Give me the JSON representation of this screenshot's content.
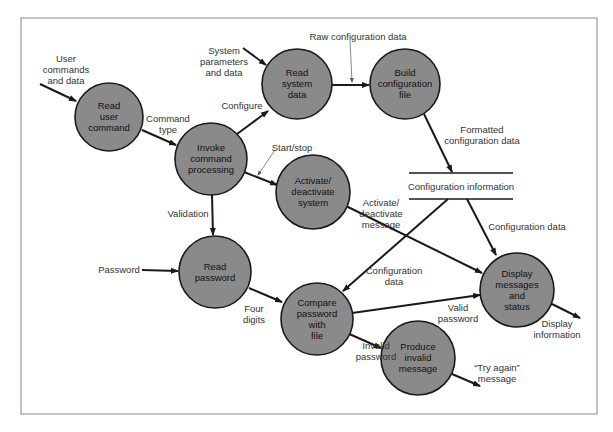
{
  "diagram": {
    "type": "data-flow-diagram",
    "processes": [
      {
        "id": "read_user_command",
        "lines": [
          "Read",
          "user",
          "command"
        ],
        "cx": 109,
        "cy": 117,
        "r": 34
      },
      {
        "id": "invoke_command_processing",
        "lines": [
          "Invoke",
          "command",
          "processing"
        ],
        "cx": 211,
        "cy": 159,
        "r": 36
      },
      {
        "id": "read_system_data",
        "lines": [
          "Read",
          "system",
          "data"
        ],
        "cx": 297,
        "cy": 84,
        "r": 35
      },
      {
        "id": "build_configuration_file",
        "lines": [
          "Build",
          "configuration",
          "file"
        ],
        "cx": 405,
        "cy": 84,
        "r": 35
      },
      {
        "id": "activate_deactivate_system",
        "lines": [
          "Activate/",
          "deactivate",
          "system"
        ],
        "cx": 313,
        "cy": 192,
        "r": 37
      },
      {
        "id": "read_password",
        "lines": [
          "Read",
          "password"
        ],
        "cx": 215,
        "cy": 272,
        "r": 36
      },
      {
        "id": "compare_password_with_file",
        "lines": [
          "Compare",
          "password",
          "with",
          "file"
        ],
        "cx": 317,
        "cy": 319,
        "r": 36
      },
      {
        "id": "produce_invalid_message",
        "lines": [
          "Produce",
          "invalid",
          "message"
        ],
        "cx": 418,
        "cy": 358,
        "r": 37
      },
      {
        "id": "display_messages_and_status",
        "lines": [
          "Display",
          "messages",
          "and",
          "status"
        ],
        "cx": 517,
        "cy": 290,
        "r": 37
      }
    ],
    "data_store": {
      "label": "Configuration information"
    },
    "flows": [
      {
        "id": "user_commands",
        "lines": [
          "User",
          "commands",
          "and data"
        ]
      },
      {
        "id": "command_type",
        "lines": [
          "Command",
          "type"
        ]
      },
      {
        "id": "system_params",
        "lines": [
          "System",
          "parameters",
          "and data"
        ]
      },
      {
        "id": "configure",
        "lines": [
          "Configure"
        ]
      },
      {
        "id": "raw_config",
        "lines": [
          "Raw configuration data"
        ]
      },
      {
        "id": "formatted_config",
        "lines": [
          "Formatted",
          "configuration data"
        ]
      },
      {
        "id": "start_stop",
        "lines": [
          "Start/stop"
        ]
      },
      {
        "id": "validation",
        "lines": [
          "Validation"
        ]
      },
      {
        "id": "password",
        "lines": [
          "Password"
        ]
      },
      {
        "id": "four_digits",
        "lines": [
          "Four",
          "digits"
        ]
      },
      {
        "id": "activate_msg",
        "lines": [
          "Activate/",
          "deactivate",
          "message"
        ]
      },
      {
        "id": "config_data_compare",
        "lines": [
          "Configuration",
          "data"
        ]
      },
      {
        "id": "config_data_display",
        "lines": [
          "Configuration data"
        ]
      },
      {
        "id": "valid_password",
        "lines": [
          "Valid",
          "password"
        ]
      },
      {
        "id": "invalid_password",
        "lines": [
          "Invalid",
          "password"
        ]
      },
      {
        "id": "display_information",
        "lines": [
          "Display",
          "information"
        ]
      },
      {
        "id": "try_again",
        "lines": [
          "“Try again”",
          "message"
        ]
      }
    ],
    "colors": {
      "process_fill": "#8a8a8a",
      "stroke": "#1a1a1a",
      "label": "#333333"
    }
  }
}
